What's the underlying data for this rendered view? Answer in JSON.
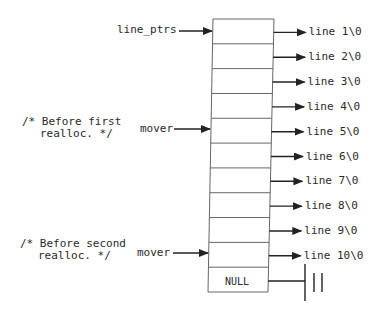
{
  "diagram": {
    "pointer_label": "line_ptrs",
    "mover_label": "mover",
    "comments": [
      {
        "line1": "/* Before first",
        "line2": "realloc. */"
      },
      {
        "line1": "/* Before second",
        "line2": "realloc. */"
      }
    ],
    "null_label": "NULL",
    "lines": [
      "line 1\\0",
      "line 2\\0",
      "line 3\\0",
      "line 4\\0",
      "line 5\\0",
      "line 6\\0",
      "line 7\\0",
      "line 8\\0",
      "line 9\\0",
      "line 10\\0"
    ],
    "colors": {
      "stroke": "#222222",
      "box_stroke": "#555555"
    }
  }
}
